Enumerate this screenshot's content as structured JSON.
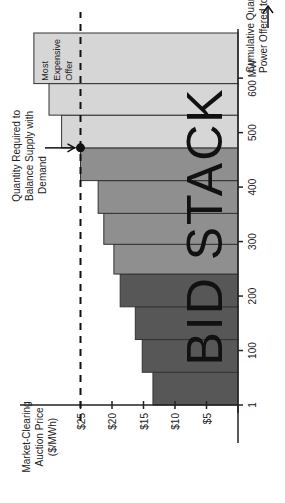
{
  "chart_data": {
    "type": "bar",
    "subtype": "stepped-supply-stack",
    "title": "",
    "overlay_label": "BID STACK",
    "xlabel": "Cumulative Quantity of Power Offered to Market",
    "ylabel": "Market-Clearing Auction Price ($/MWh)",
    "x_ticks": [
      "1",
      "100",
      "200",
      "300",
      "400",
      "500",
      "600 MW"
    ],
    "y_ticks": [
      "$5",
      "$10",
      "$15",
      "$20",
      "$25"
    ],
    "ylim": [
      0,
      35
    ],
    "xlim": [
      0,
      750
    ],
    "clearing_price": 25,
    "clearing_price_label": "$25",
    "demand_quantity": 620,
    "demand_annotation": "Quantity Required to Balance Supply with Demand",
    "expensive_annotation": "Most Expensive Offer",
    "bars": [
      {
        "x_start": 0,
        "x_end": 55,
        "price": 13.5,
        "shade": "dark"
      },
      {
        "x_start": 55,
        "x_end": 110,
        "price": 15.2,
        "shade": "dark"
      },
      {
        "x_start": 110,
        "x_end": 165,
        "price": 16.3,
        "shade": "dark"
      },
      {
        "x_start": 165,
        "x_end": 220,
        "price": 18.7,
        "shade": "dark"
      },
      {
        "x_start": 220,
        "x_end": 270,
        "price": 19.7,
        "shade": "mid"
      },
      {
        "x_start": 270,
        "x_end": 322,
        "price": 21.3,
        "shade": "mid"
      },
      {
        "x_start": 322,
        "x_end": 377,
        "price": 22.2,
        "shade": "mid"
      },
      {
        "x_start": 377,
        "x_end": 432,
        "price": 25.0,
        "shade": "mid"
      },
      {
        "x_start": 432,
        "x_end": 487,
        "price": 28.0,
        "shade": "light"
      },
      {
        "x_start": 487,
        "x_end": 540,
        "price": 30.0,
        "shade": "light"
      },
      {
        "x_start": 540,
        "x_end": 625,
        "price": 32.4,
        "shade": "light"
      }
    ],
    "colors": {
      "dark": "#575757",
      "mid": "#8f8f8f",
      "light": "#d6d6d6",
      "outline": "#333333"
    },
    "grid": false,
    "legend": null
  }
}
